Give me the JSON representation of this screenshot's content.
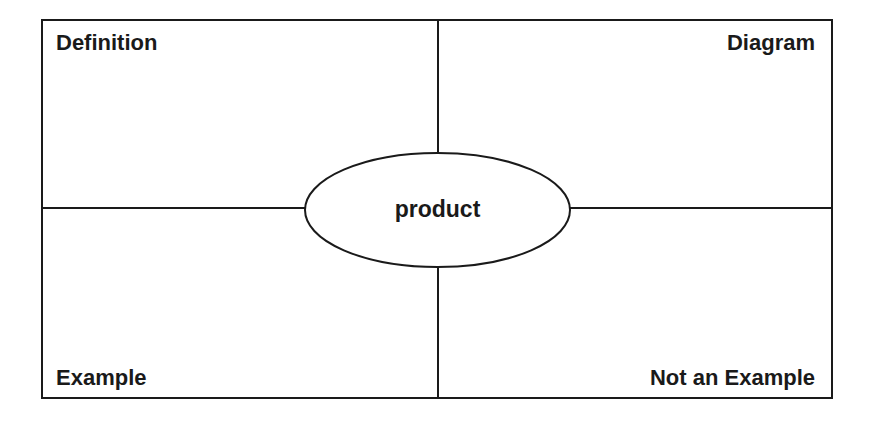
{
  "diagram": {
    "type": "frayer-model",
    "center_term": "product",
    "quadrants": {
      "top_left": "Definition",
      "top_right": "Diagram",
      "bottom_left": "Example",
      "bottom_right": "Not an Example"
    },
    "colors": {
      "line": "#1a1a1a",
      "background": "#ffffff",
      "text": "#1a1a1a"
    }
  }
}
